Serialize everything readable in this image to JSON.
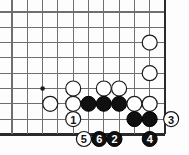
{
  "diagram": {
    "kind": "go-board-problem-diagram",
    "title": "",
    "board": {
      "origin_x": 12,
      "origin_y": 12,
      "spacing": 15.3,
      "cols": 11,
      "rows": 9,
      "right_edge_col": 10,
      "bottom_edge_row": 8,
      "line_color": "#6f6f6f",
      "edge_color": "#2a2a2a",
      "background": "#fdfdfd"
    },
    "hoshi_points": [
      {
        "col": 2,
        "row": 5
      }
    ],
    "stones": [
      {
        "id": "w-a",
        "color": "white",
        "col": 9,
        "row": 2,
        "label": ""
      },
      {
        "id": "w-b",
        "color": "white",
        "col": 9,
        "row": 4,
        "label": ""
      },
      {
        "id": "w-c",
        "color": "white",
        "col": 4,
        "row": 5,
        "label": ""
      },
      {
        "id": "w-d",
        "color": "white",
        "col": 6,
        "row": 5,
        "label": ""
      },
      {
        "id": "w-e",
        "color": "white",
        "col": 7,
        "row": 5,
        "label": ""
      },
      {
        "id": "w-f",
        "color": "white",
        "col": 2.5,
        "row": 6,
        "label": ""
      },
      {
        "id": "w-g",
        "color": "white",
        "col": 4,
        "row": 6,
        "label": ""
      },
      {
        "id": "b-a",
        "color": "black",
        "col": 5,
        "row": 6,
        "label": ""
      },
      {
        "id": "b-b",
        "color": "black",
        "col": 6,
        "row": 6,
        "label": ""
      },
      {
        "id": "b-c",
        "color": "black",
        "col": 7,
        "row": 6,
        "label": ""
      },
      {
        "id": "w-h",
        "color": "white",
        "col": 8,
        "row": 6,
        "label": ""
      },
      {
        "id": "w-i",
        "color": "white",
        "col": 9,
        "row": 6,
        "label": ""
      },
      {
        "id": "m1",
        "color": "white",
        "col": 4,
        "row": 7,
        "label": "1"
      },
      {
        "id": "b-d",
        "color": "black",
        "col": 8,
        "row": 7,
        "label": ""
      },
      {
        "id": "b-e",
        "color": "black",
        "col": 9,
        "row": 7,
        "label": ""
      },
      {
        "id": "m3",
        "color": "white",
        "col": 10.4,
        "row": 7,
        "label": "3"
      },
      {
        "id": "m5",
        "color": "white",
        "col": 4.7,
        "row": 8.3,
        "label": "5"
      },
      {
        "id": "m6",
        "color": "black",
        "col": 5.7,
        "row": 8.3,
        "label": "6"
      },
      {
        "id": "m2",
        "color": "black",
        "col": 6.7,
        "row": 8.3,
        "label": "2"
      },
      {
        "id": "m4",
        "color": "black",
        "col": 9,
        "row": 8.3,
        "label": "4"
      }
    ],
    "move_numbers": [
      "1",
      "2",
      "3",
      "4",
      "5",
      "6"
    ],
    "colors": {
      "black_stone": "#101010",
      "white_stone": "#ffffff",
      "stone_outline": "#1a1a1a",
      "label_on_black": "#ffffff",
      "label_on_white": "#111111"
    }
  }
}
